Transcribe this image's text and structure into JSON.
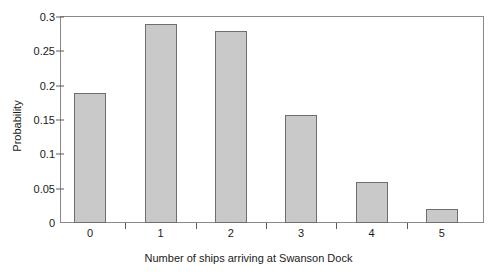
{
  "chart_data": {
    "type": "bar",
    "title": "",
    "xlabel": "Number of ships arriving at Swanson Dock",
    "ylabel": "Probability",
    "categories": [
      "0",
      "1",
      "2",
      "3",
      "4",
      "5"
    ],
    "values": [
      0.19,
      0.29,
      0.28,
      0.158,
      0.06,
      0.02
    ],
    "ylim": [
      0,
      0.3
    ],
    "yticks": [
      0,
      0.05,
      0.1,
      0.15,
      0.2,
      0.25,
      0.3
    ],
    "ytick_labels": [
      "0",
      "0.05",
      "0.1",
      "0.15",
      "0.2",
      "0.25",
      "0.3"
    ],
    "grid": false,
    "legend": null,
    "bar_fill_color": "#c9c9c9",
    "bar_edge_color": "#6e6e6e",
    "axis_color": "#8a8a8a",
    "background_color": "#ffffff"
  }
}
